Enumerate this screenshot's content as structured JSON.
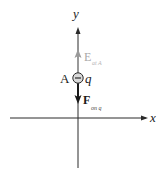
{
  "diagram": {
    "type": "electric-field-force-on-charge",
    "axes": {
      "x_label": "x",
      "y_label": "y"
    },
    "charge": {
      "point_label": "A",
      "charge_label": "q",
      "sign_symbol": "−"
    },
    "field_vector": {
      "main": "E",
      "subscript": "at A",
      "direction": "up",
      "color": "#9a9a9a"
    },
    "force_vector": {
      "main": "F",
      "subscript": "on q",
      "direction": "down",
      "color": "#1a1a1a"
    }
  },
  "colors": {
    "axis": "#2a2a2a",
    "field": "#9a9a9a",
    "force": "#1a1a1a",
    "field_text": "#a8a8a8",
    "background": "#ffffff"
  }
}
